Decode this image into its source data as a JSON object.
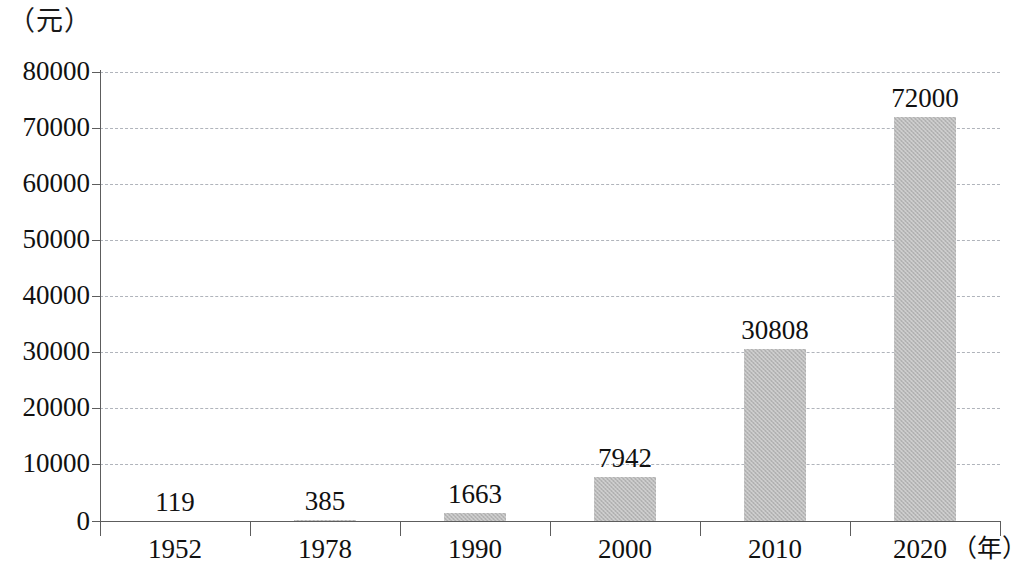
{
  "chart_data": {
    "type": "bar",
    "title": "",
    "xlabel": "（年）",
    "ylabel": "（元）",
    "categories": [
      "1952",
      "1978",
      "1990",
      "2000",
      "2010",
      "2020"
    ],
    "values": [
      119,
      385,
      1663,
      7942,
      30808,
      72000
    ],
    "value_labels": [
      "119",
      "385",
      "1663",
      "7942",
      "30808",
      "72000"
    ],
    "ylim": [
      0,
      80000
    ],
    "ytick_labels": [
      "0",
      "10000",
      "20000",
      "30000",
      "40000",
      "50000",
      "60000",
      "70000",
      "80000"
    ],
    "ytick_values": [
      0,
      10000,
      20000,
      30000,
      40000,
      50000,
      60000,
      70000,
      80000
    ],
    "grid": true,
    "grid_style": "dashed-horizontal",
    "legend": "none",
    "bar_color": "#b9b9b9",
    "axis_color": "#5d5d5d",
    "grid_color": "#b0b4bb"
  },
  "axis": {
    "y_unit": "（元）",
    "x_unit": "（年）"
  }
}
